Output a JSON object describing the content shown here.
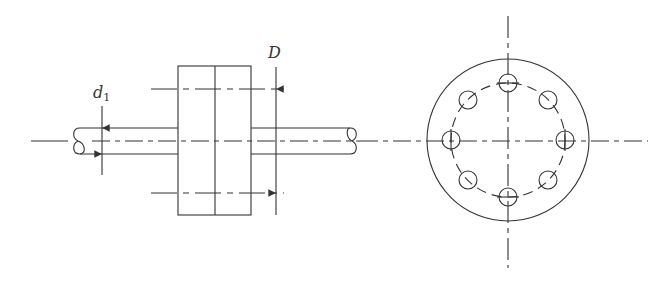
{
  "figure": {
    "labels": {
      "d1": "d",
      "d1_sub": "1",
      "D": "D"
    },
    "side_view": {
      "shaft_diameter_label": "d1",
      "bolt_circle_label": "D",
      "flange_halves": 2
    },
    "end_view": {
      "bolt_holes": 8
    },
    "colors": {
      "line": "#333333",
      "background": "#ffffff"
    }
  }
}
